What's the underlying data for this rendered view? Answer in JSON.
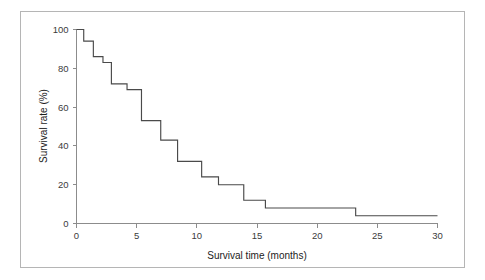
{
  "figure": {
    "frame_border_color": "#b5b5b5",
    "background_color": "#ffffff"
  },
  "chart_data": {
    "type": "line",
    "subtype": "kaplan-meier-step",
    "title": "",
    "subtitle": "",
    "xlabel": "Survival time (months)",
    "ylabel": "Survival rate (%)",
    "xlim": [
      0,
      30
    ],
    "ylim": [
      0,
      100
    ],
    "grid": false,
    "legend_position": "none",
    "x_ticks": [
      0,
      5,
      10,
      15,
      20,
      25,
      30
    ],
    "x_tick_labels": [
      "0",
      "5",
      "10",
      "15",
      "20",
      "25",
      "30"
    ],
    "y_ticks": [
      0,
      20,
      40,
      60,
      80,
      100
    ],
    "y_tick_labels": [
      "0",
      "20",
      "40",
      "60",
      "80",
      "100"
    ],
    "series": [
      {
        "name": "Survival",
        "color": "#4a4a4a",
        "x": [
          0,
          0.6,
          1.1,
          1.4,
          2.2,
          2.9,
          4.2,
          5.4,
          7.0,
          8.4,
          10.4,
          11.8,
          13.9,
          15.7,
          23.2,
          30.0
        ],
        "y": [
          100,
          94,
          94,
          86,
          83,
          72,
          69,
          53,
          43,
          32,
          24,
          20,
          12,
          8,
          4,
          4
        ]
      }
    ],
    "steps": [
      {
        "time": 0.0,
        "rate": 100
      },
      {
        "time": 0.6,
        "rate": 94
      },
      {
        "time": 1.4,
        "rate": 86
      },
      {
        "time": 2.2,
        "rate": 83
      },
      {
        "time": 2.9,
        "rate": 72
      },
      {
        "time": 4.2,
        "rate": 69
      },
      {
        "time": 5.4,
        "rate": 53
      },
      {
        "time": 7.0,
        "rate": 43
      },
      {
        "time": 8.4,
        "rate": 32
      },
      {
        "time": 10.4,
        "rate": 24
      },
      {
        "time": 11.8,
        "rate": 20
      },
      {
        "time": 13.9,
        "rate": 12
      },
      {
        "time": 15.7,
        "rate": 8
      },
      {
        "time": 23.2,
        "rate": 4
      },
      {
        "time": 30.0,
        "rate": 4
      }
    ]
  }
}
